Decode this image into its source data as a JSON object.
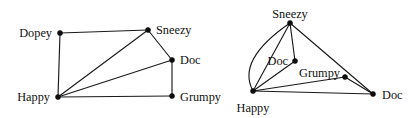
{
  "figure": {
    "background_color": "#ffffff",
    "line_color": "#1a1a1a",
    "node_color": "#0d0d0d",
    "text_color": "#111111"
  },
  "graphs": [
    {
      "id": "left-graph",
      "name": "left-graph",
      "nodes": [
        {
          "id": "dopey",
          "label": "Dopey",
          "x": 60,
          "y": 33,
          "label_x": 52,
          "label_y": 33,
          "anchor": "end"
        },
        {
          "id": "sneezy",
          "label": "Sneezy",
          "x": 148,
          "y": 30,
          "label_x": 156,
          "label_y": 30,
          "anchor": "start"
        },
        {
          "id": "doc",
          "label": "Doc",
          "x": 172,
          "y": 60,
          "label_x": 180,
          "label_y": 60,
          "anchor": "start"
        },
        {
          "id": "grumpy",
          "label": "Grumpy",
          "x": 172,
          "y": 96,
          "label_x": 180,
          "label_y": 97,
          "anchor": "start"
        },
        {
          "id": "happy",
          "label": "Happy",
          "x": 58,
          "y": 97,
          "label_x": 50,
          "label_y": 97,
          "anchor": "end"
        }
      ],
      "edges": [
        {
          "from": "dopey",
          "to": "sneezy",
          "curved": false
        },
        {
          "from": "dopey",
          "to": "happy",
          "curved": false
        },
        {
          "from": "happy",
          "to": "sneezy",
          "curved": false
        },
        {
          "from": "happy",
          "to": "doc",
          "curved": false
        },
        {
          "from": "happy",
          "to": "grumpy",
          "curved": false
        },
        {
          "from": "sneezy",
          "to": "doc",
          "curved": false
        },
        {
          "from": "doc",
          "to": "grumpy",
          "curved": false
        }
      ]
    },
    {
      "id": "right-graph",
      "name": "right-graph",
      "nodes": [
        {
          "id": "sneezy2",
          "label": "Sneezy",
          "x": 290,
          "y": 23,
          "label_x": 290,
          "label_y": 14,
          "anchor": "middle"
        },
        {
          "id": "doc2",
          "label": "Doc",
          "x": 295,
          "y": 61,
          "label_x": 288,
          "label_y": 61,
          "anchor": "end"
        },
        {
          "id": "grumpy2",
          "label": "Grumpy",
          "x": 345,
          "y": 77,
          "label_x": 340,
          "label_y": 73,
          "anchor": "end"
        },
        {
          "id": "happy2",
          "label": "Happy",
          "x": 253,
          "y": 91,
          "label_x": 253,
          "label_y": 108,
          "anchor": "middle"
        },
        {
          "id": "docfar",
          "label": "Doc",
          "x": 373,
          "y": 94,
          "label_x": 382,
          "label_y": 95,
          "anchor": "start"
        }
      ],
      "edges": [
        {
          "from": "sneezy2",
          "to": "doc2",
          "curved": false
        },
        {
          "from": "sneezy2",
          "to": "happy2",
          "curved": true,
          "bulge_x": 236,
          "bulge_y": 60
        },
        {
          "from": "sneezy2",
          "to": "happy2",
          "curved": false
        },
        {
          "from": "sneezy2",
          "to": "docfar",
          "curved": false
        },
        {
          "from": "doc2",
          "to": "happy2",
          "curved": false
        },
        {
          "from": "happy2",
          "to": "grumpy2",
          "curved": false
        },
        {
          "from": "happy2",
          "to": "docfar",
          "curved": false
        },
        {
          "from": "grumpy2",
          "to": "docfar",
          "curved": false
        }
      ]
    }
  ]
}
